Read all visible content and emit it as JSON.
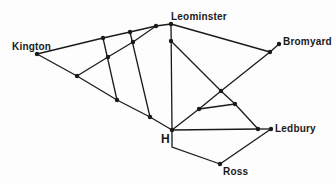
{
  "diagram": {
    "type": "network",
    "line_color": "#1a1a1a",
    "background": "#fdfdfd",
    "labels": [
      {
        "id": "kington",
        "text": "Kington",
        "x": 12,
        "y": 42
      },
      {
        "id": "leominster",
        "text": "Leominster",
        "x": 171,
        "y": 12
      },
      {
        "id": "bromyard",
        "text": "Bromyard",
        "x": 283,
        "y": 37
      },
      {
        "id": "h",
        "text": "H",
        "x": 161,
        "y": 133,
        "big": true
      },
      {
        "id": "ledbury",
        "text": "Ledbury",
        "x": 275,
        "y": 124
      },
      {
        "id": "ross",
        "text": "Ross",
        "x": 223,
        "y": 167
      }
    ],
    "nodes": [
      {
        "id": "kington",
        "x": 37,
        "y": 54
      },
      {
        "id": "t1",
        "x": 103,
        "y": 38
      },
      {
        "id": "t2",
        "x": 130,
        "y": 32
      },
      {
        "id": "t3",
        "x": 156,
        "y": 26
      },
      {
        "id": "leominster",
        "x": 171,
        "y": 24
      },
      {
        "id": "m1",
        "x": 77,
        "y": 76
      },
      {
        "id": "m2",
        "x": 108,
        "y": 57
      },
      {
        "id": "m3",
        "x": 133,
        "y": 42
      },
      {
        "id": "b1",
        "x": 117,
        "y": 100
      },
      {
        "id": "b2",
        "x": 150,
        "y": 117
      },
      {
        "id": "h",
        "x": 172,
        "y": 130
      },
      {
        "id": "v1",
        "x": 171,
        "y": 41
      },
      {
        "id": "bromyard_j",
        "x": 270,
        "y": 52
      },
      {
        "id": "bromyard",
        "x": 279,
        "y": 44
      },
      {
        "id": "x1",
        "x": 221,
        "y": 91
      },
      {
        "id": "p1",
        "x": 199,
        "y": 109
      },
      {
        "id": "p2",
        "x": 235,
        "y": 104
      },
      {
        "id": "ledbury_j",
        "x": 258,
        "y": 129
      },
      {
        "id": "ledbury",
        "x": 271,
        "y": 129
      },
      {
        "id": "ross",
        "x": 220,
        "y": 164
      }
    ],
    "edges": [
      [
        "kington",
        "t1"
      ],
      [
        "t1",
        "t2"
      ],
      [
        "t2",
        "t3"
      ],
      [
        "t3",
        "leominster"
      ],
      [
        "kington",
        "m1"
      ],
      [
        "m1",
        "b1"
      ],
      [
        "b1",
        "b2"
      ],
      [
        "b2",
        "h"
      ],
      [
        "m1",
        "m2"
      ],
      [
        "m2",
        "m3"
      ],
      [
        "m3",
        "t3"
      ],
      [
        "t1",
        "b1"
      ],
      [
        "t2",
        "b2"
      ],
      [
        "leominster",
        "h"
      ],
      [
        "leominster",
        "bromyard_j"
      ],
      [
        "bromyard_j",
        "bromyard"
      ],
      [
        "bromyard_j",
        "x1"
      ],
      [
        "x1",
        "p1"
      ],
      [
        "p1",
        "h"
      ],
      [
        "v1",
        "x1"
      ],
      [
        "x1",
        "p2"
      ],
      [
        "p2",
        "ledbury_j"
      ],
      [
        "p1",
        "p2"
      ],
      [
        "h",
        "ledbury_j"
      ],
      [
        "ledbury_j",
        "ledbury"
      ],
      [
        "ledbury",
        "ross"
      ]
    ],
    "polylines": [
      {
        "id": "h-ross",
        "points": [
          [
            172,
            130
          ],
          [
            172,
            147
          ],
          [
            220,
            164
          ]
        ]
      }
    ]
  }
}
